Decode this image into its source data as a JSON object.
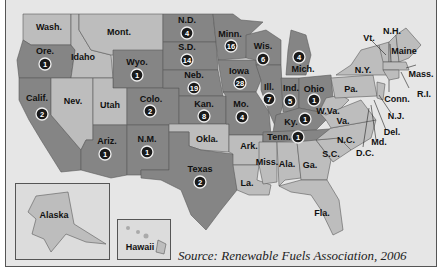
{
  "source": "Source: Renewable Fuels Association, 2006",
  "colors": {
    "background": "#e6e6e6",
    "producing_state": "#858585",
    "non_producing_state": "#bdbdbd",
    "badge": "#1a1a1a"
  },
  "states": [
    {
      "name": "Wash.",
      "plants": null
    },
    {
      "name": "Ore.",
      "plants": 1
    },
    {
      "name": "Calif.",
      "plants": 2
    },
    {
      "name": "Idaho",
      "plants": null
    },
    {
      "name": "Nev.",
      "plants": null
    },
    {
      "name": "Mont.",
      "plants": null
    },
    {
      "name": "Wyo.",
      "plants": 1
    },
    {
      "name": "Utah",
      "plants": null
    },
    {
      "name": "Colo.",
      "plants": 2
    },
    {
      "name": "Ariz.",
      "plants": 1
    },
    {
      "name": "N.M.",
      "plants": 1
    },
    {
      "name": "N.D.",
      "plants": 4
    },
    {
      "name": "S.D.",
      "plants": 14
    },
    {
      "name": "Neb.",
      "plants": 19
    },
    {
      "name": "Kan.",
      "plants": 8
    },
    {
      "name": "Okla.",
      "plants": null
    },
    {
      "name": "Texas",
      "plants": 2
    },
    {
      "name": "Minn.",
      "plants": 16
    },
    {
      "name": "Iowa",
      "plants": 28
    },
    {
      "name": "Mo.",
      "plants": 4
    },
    {
      "name": "Ark.",
      "plants": null
    },
    {
      "name": "La.",
      "plants": null
    },
    {
      "name": "Wis.",
      "plants": 6
    },
    {
      "name": "Ill.",
      "plants": 7
    },
    {
      "name": "Mich.",
      "plants": 4
    },
    {
      "name": "Ind.",
      "plants": 5
    },
    {
      "name": "Ohio",
      "plants": 1
    },
    {
      "name": "Ky.",
      "plants": 1
    },
    {
      "name": "Tenn.",
      "plants": 1
    },
    {
      "name": "Miss.",
      "plants": null
    },
    {
      "name": "Ala.",
      "plants": null
    },
    {
      "name": "Ga.",
      "plants": null
    },
    {
      "name": "Fla.",
      "plants": null
    },
    {
      "name": "S.C.",
      "plants": null
    },
    {
      "name": "N.C.",
      "plants": null
    },
    {
      "name": "Va.",
      "plants": null
    },
    {
      "name": "W.Va.",
      "plants": null
    },
    {
      "name": "Pa.",
      "plants": null
    },
    {
      "name": "N.Y.",
      "plants": null
    },
    {
      "name": "Vt.",
      "plants": null
    },
    {
      "name": "N.H.",
      "plants": null
    },
    {
      "name": "Maine",
      "plants": null
    },
    {
      "name": "Mass.",
      "plants": null
    },
    {
      "name": "R.I.",
      "plants": null
    },
    {
      "name": "Conn.",
      "plants": null
    },
    {
      "name": "N.J.",
      "plants": null
    },
    {
      "name": "Del.",
      "plants": null
    },
    {
      "name": "Md.",
      "plants": null
    },
    {
      "name": "D.C.",
      "plants": null
    },
    {
      "name": "Alaska",
      "plants": null
    },
    {
      "name": "Hawaii",
      "plants": null
    }
  ],
  "labels": {
    "wash": "Wash.",
    "ore": "Ore.",
    "calif": "Calif.",
    "idaho": "Idaho",
    "nev": "Nev.",
    "mont": "Mont.",
    "wyo": "Wyo.",
    "utah": "Utah",
    "colo": "Colo.",
    "ariz": "Ariz.",
    "nm": "N.M.",
    "nd": "N.D.",
    "sd": "S.D.",
    "neb": "Neb.",
    "kan": "Kan.",
    "okla": "Okla.",
    "texas": "Texas",
    "minn": "Minn.",
    "iowa": "Iowa",
    "mo": "Mo.",
    "ark": "Ark.",
    "la": "La.",
    "wis": "Wis.",
    "ill": "Ill.",
    "mich": "Mich.",
    "ind": "Ind.",
    "ohio": "Ohio",
    "ky": "Ky.",
    "tenn": "Tenn.",
    "miss": "Miss.",
    "ala": "Ala.",
    "ga": "Ga.",
    "fla": "Fla.",
    "sc": "S.C.",
    "nc": "N.C.",
    "va": "Va.",
    "wva": "W.Va.",
    "pa": "Pa.",
    "ny": "N.Y.",
    "vt": "Vt.",
    "nh": "N.H.",
    "maine": "Maine",
    "mass": "Mass.",
    "ri": "R.I.",
    "conn": "Conn.",
    "nj": "N.J.",
    "del": "Del.",
    "md": "Md.",
    "dc": "D.C.",
    "alaska": "Alaska",
    "hawaii": "Hawaii"
  },
  "counts": {
    "ore": "1",
    "calif": "2",
    "wyo": "1",
    "colo": "2",
    "ariz": "1",
    "nm": "1",
    "nd": "4",
    "sd": "14",
    "neb": "19",
    "kan": "8",
    "texas": "2",
    "minn": "16",
    "iowa": "28",
    "mo": "4",
    "wis": "6",
    "ill": "7",
    "mich": "4",
    "ind": "5",
    "ohio": "1",
    "ky": "1",
    "tenn": "1"
  }
}
